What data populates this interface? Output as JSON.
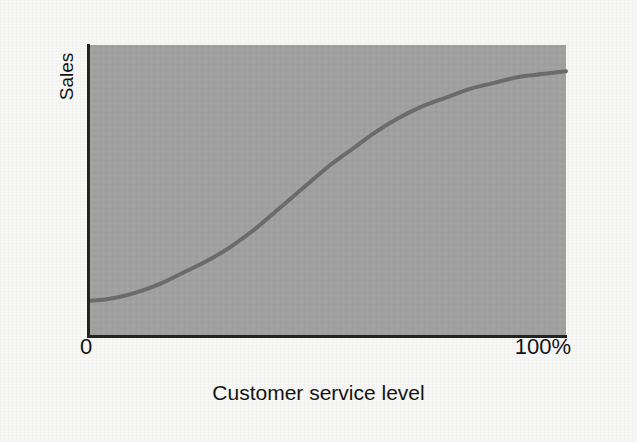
{
  "figure": {
    "background_color": "#f7f7f5",
    "width": 637,
    "height": 442
  },
  "axes": {
    "y_title": "Sales",
    "x_title": "Customer service level",
    "x_tick_min": "0",
    "x_tick_max": "100%",
    "axis_line_color": "#232323",
    "plot_background_color": "#a0a0a0"
  },
  "chart_data": {
    "type": "line",
    "title": "",
    "subtitle": "",
    "xlabel": "Customer service level",
    "ylabel": "Sales",
    "xlim": [
      0,
      100
    ],
    "ylim": [
      0,
      100
    ],
    "x_tick_labels": [
      "0",
      "100%"
    ],
    "x_ticks": [
      0,
      100
    ],
    "y_tick_labels": [],
    "y_ticks": [],
    "grid": false,
    "legend": null,
    "annotations": [],
    "series": [
      {
        "name": "Sales response to customer service level",
        "line_color": "#6b6b6b",
        "line_width": 4,
        "shape": "sigmoid / S-curve",
        "x": [
          0,
          5,
          10,
          15,
          20,
          25,
          30,
          35,
          40,
          45,
          50,
          55,
          60,
          65,
          70,
          75,
          80,
          85,
          90,
          95,
          100
        ],
        "y": [
          12,
          13,
          15,
          18,
          22,
          26,
          31,
          37,
          44,
          51,
          58,
          64,
          70,
          75,
          79,
          82,
          85,
          87,
          89,
          90,
          91
        ]
      }
    ]
  },
  "icons": {
    "curve": "line-curve-icon"
  }
}
